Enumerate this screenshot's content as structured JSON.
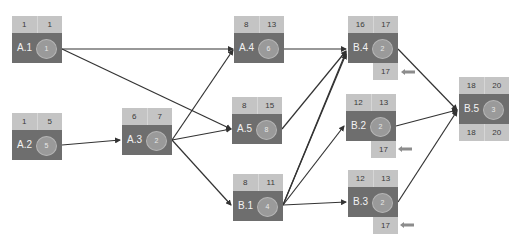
{
  "diagram": {
    "type": "activity-on-node network",
    "colors": {
      "cell_light": "#c4c4c4",
      "cell_dark": "#6e6e6e",
      "circle": "#9a9a9a",
      "edge": "#333333",
      "slack_arrow": "#8c8c8c"
    },
    "nodes": [
      {
        "id": "A.1",
        "es": "1",
        "ef": "1",
        "duration": "1"
      },
      {
        "id": "A.2",
        "es": "1",
        "ef": "5",
        "duration": "5"
      },
      {
        "id": "A.3",
        "es": "6",
        "ef": "7",
        "duration": "2"
      },
      {
        "id": "A.4",
        "es": "8",
        "ef": "13",
        "duration": "6"
      },
      {
        "id": "A.5",
        "es": "8",
        "ef": "15",
        "duration": "8"
      },
      {
        "id": "B.1",
        "es": "8",
        "ef": "11",
        "duration": "4"
      },
      {
        "id": "B.4",
        "es": "16",
        "ef": "17",
        "duration": "2",
        "slack_value": "17"
      },
      {
        "id": "B.2",
        "es": "12",
        "ef": "13",
        "duration": "2",
        "slack_value": "17"
      },
      {
        "id": "B.3",
        "es": "12",
        "ef": "13",
        "duration": "2",
        "slack_value": "17"
      },
      {
        "id": "B.5",
        "es": "18",
        "ef": "20",
        "duration": "3",
        "ls": "18",
        "lf": "20"
      }
    ],
    "edges": [
      {
        "from": "A.1",
        "to": "A.4"
      },
      {
        "from": "A.1",
        "to": "A.5"
      },
      {
        "from": "A.2",
        "to": "A.3"
      },
      {
        "from": "A.3",
        "to": "A.4"
      },
      {
        "from": "A.3",
        "to": "A.5"
      },
      {
        "from": "A.3",
        "to": "B.1"
      },
      {
        "from": "A.4",
        "to": "B.4"
      },
      {
        "from": "A.5",
        "to": "B.4"
      },
      {
        "from": "B.1",
        "to": "B.4"
      },
      {
        "from": "B.1",
        "to": "B.4"
      },
      {
        "from": "B.1",
        "to": "B.2"
      },
      {
        "from": "B.1",
        "to": "B.3"
      },
      {
        "from": "B.4",
        "to": "B.5"
      },
      {
        "from": "B.2",
        "to": "B.5"
      },
      {
        "from": "B.3",
        "to": "B.5"
      }
    ]
  }
}
